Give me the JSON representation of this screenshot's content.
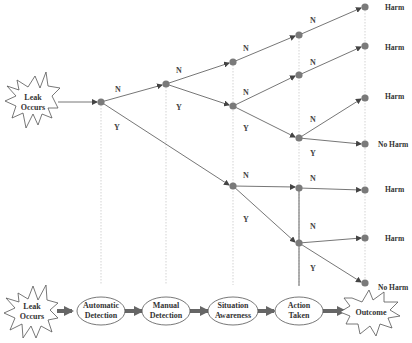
{
  "diagram": {
    "type": "event-tree",
    "initiating_event": {
      "line1": "Leak",
      "line2": "Occurs"
    },
    "branch_labels": {
      "no": "N",
      "yes": "Y"
    },
    "outcomes": [
      {
        "label": "Harm"
      },
      {
        "label": "Harm"
      },
      {
        "label": "Harm"
      },
      {
        "label": "No Harm"
      },
      {
        "label": "Harm"
      },
      {
        "label": "Harm"
      },
      {
        "label": "No Harm"
      }
    ],
    "sequence": [
      {
        "line1": "Leak",
        "line2": "Occurs",
        "shape": "burst"
      },
      {
        "line1": "Automatic",
        "line2": "Detection",
        "shape": "ellipse"
      },
      {
        "line1": "Manual",
        "line2": "Detection",
        "shape": "ellipse"
      },
      {
        "line1": "Situation",
        "line2": "Awareness",
        "shape": "ellipse"
      },
      {
        "line1": "Action",
        "line2": "Taken",
        "shape": "ellipse"
      },
      {
        "line1": "Outcome",
        "line2": "",
        "shape": "burst"
      }
    ],
    "colors": {
      "node": "#7a7a7a",
      "line": "#555555",
      "dotted": "#bbbbbb",
      "arrow": "#666666"
    }
  }
}
